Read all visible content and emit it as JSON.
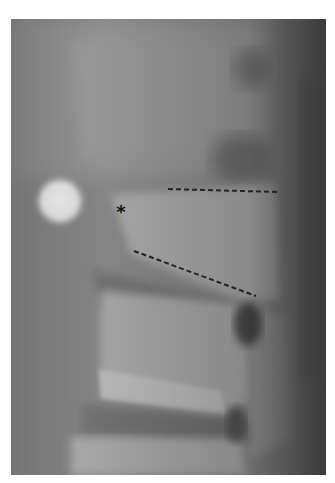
{
  "figure": {
    "type": "lateral spine radiograph",
    "annotations": {
      "asterisk": "*",
      "dashed_lines": [
        {
          "name": "upper-endplate-line",
          "x1": 168,
          "y1": 189,
          "x2": 280,
          "y2": 192
        },
        {
          "name": "lower-endplate-line",
          "x1": 134,
          "y1": 251,
          "x2": 256,
          "y2": 296
        }
      ]
    },
    "colors": {
      "background": "#ffffff",
      "film_mid": "#8e8e8e",
      "bone_light": "#c8c8c8",
      "dark_soft_tissue": "#3a3a3a",
      "annotation": "#222222"
    }
  }
}
